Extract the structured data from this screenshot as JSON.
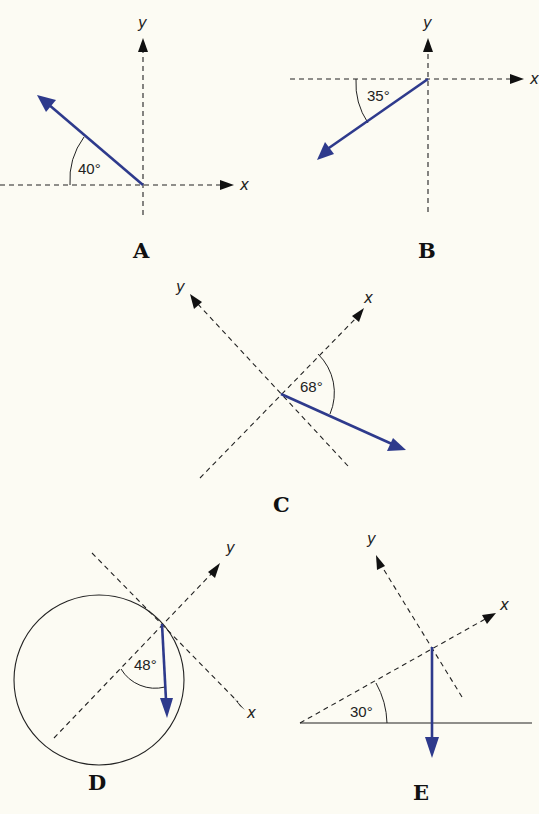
{
  "figure": {
    "colors": {
      "background": "#fcfbf3",
      "vector": "#2e3a8c",
      "axes": "#222222"
    },
    "panels": [
      {
        "id": "A",
        "label": "A",
        "angle": "40°",
        "x_axis_label": "x",
        "y_axis_label": "y",
        "description": "Vector pointing up-left at 40° above negative x-axis"
      },
      {
        "id": "B",
        "label": "B",
        "angle": "35°",
        "x_axis_label": "x",
        "y_axis_label": "y",
        "description": "Vector pointing down-left at 35° below negative x-axis"
      },
      {
        "id": "C",
        "label": "C",
        "angle": "68°",
        "x_axis_label": "x",
        "y_axis_label": "y",
        "description": "Rotated axes; vector at 68° from positive x-axis"
      },
      {
        "id": "D",
        "label": "D",
        "angle": "48°",
        "x_axis_label": "x",
        "y_axis_label": "y",
        "description": "Circle with tangent axes; vertical downward vector at 48° from radial line"
      },
      {
        "id": "E",
        "label": "E",
        "angle": "30°",
        "x_axis_label": "x",
        "y_axis_label": "y",
        "description": "Incline at 30°; tilted axes; vertical downward vector"
      }
    ]
  }
}
